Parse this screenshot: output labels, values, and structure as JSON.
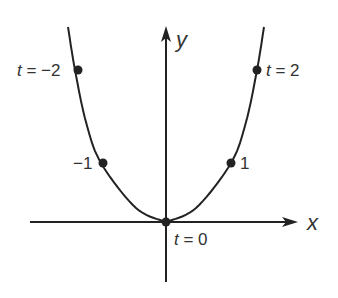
{
  "diagram": {
    "type": "parametric-curve",
    "axes": {
      "x_label": "x",
      "y_label": "y"
    },
    "points": [
      {
        "t": -2,
        "label_var": "t",
        "label_eq": " = ",
        "label_val": "−2",
        "full_label": "t = −2"
      },
      {
        "t": -1,
        "label_var": "",
        "label_eq": "",
        "label_val": "−1",
        "full_label": "−1"
      },
      {
        "t": 0,
        "label_var": "t",
        "label_eq": " = ",
        "label_val": "0",
        "full_label": "t = 0"
      },
      {
        "t": 1,
        "label_var": "",
        "label_eq": "",
        "label_val": "1",
        "full_label": "1"
      },
      {
        "t": 2,
        "label_var": "t",
        "label_eq": " = ",
        "label_val": "2",
        "full_label": "t = 2"
      }
    ],
    "colors": {
      "ink": "#222222",
      "text": "#333333",
      "background": "#ffffff"
    }
  }
}
